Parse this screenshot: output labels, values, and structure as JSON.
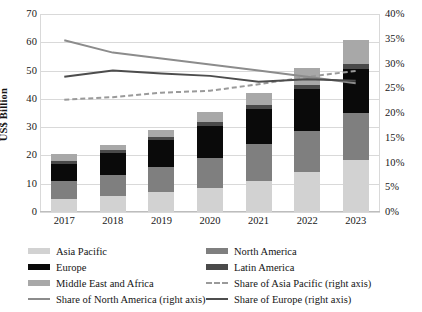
{
  "chart_data": {
    "type": "bar",
    "title": "",
    "subtitle": "",
    "xlabel": "",
    "ylabel": "US$ Billion",
    "y2label": "",
    "categories": [
      "2017",
      "2018",
      "2019",
      "2020",
      "2021",
      "2022",
      "2023"
    ],
    "ylim": [
      0,
      70
    ],
    "yticks": [
      0,
      10,
      20,
      30,
      40,
      50,
      60,
      70
    ],
    "ytick_labels": [
      "0",
      "10",
      "20",
      "30",
      "40",
      "50",
      "60",
      "70"
    ],
    "y2lim": [
      0,
      40
    ],
    "y2ticks": [
      0,
      5,
      10,
      15,
      20,
      25,
      30,
      35,
      40
    ],
    "y2tick_labels": [
      "0%",
      "5%",
      "10%",
      "15%",
      "20%",
      "25%",
      "30%",
      "35%",
      "40%"
    ],
    "grid": true,
    "legend_position": "bottom",
    "stacked": true,
    "series": [
      {
        "name": "Asia Pacific",
        "kind": "bar",
        "axis": "left",
        "color": "#d2d2d2",
        "values": [
          4.5,
          5.5,
          7.0,
          8.5,
          11.0,
          14.0,
          18.5
        ]
      },
      {
        "name": "North America",
        "kind": "bar",
        "axis": "left",
        "color": "#7f7f7f",
        "values": [
          6.5,
          7.5,
          9.0,
          10.5,
          13.0,
          14.5,
          16.5
        ]
      },
      {
        "name": "Europe",
        "kind": "bar",
        "axis": "left",
        "color": "#0a0a0a",
        "values": [
          6.0,
          8.0,
          9.5,
          11.5,
          12.5,
          15.0,
          15.5
        ]
      },
      {
        "name": "Latin America",
        "kind": "bar",
        "axis": "left",
        "color": "#4a4a4a",
        "values": [
          1.0,
          0.8,
          1.0,
          1.2,
          1.5,
          1.5,
          2.0
        ]
      },
      {
        "name": "Middle East and Africa",
        "kind": "bar",
        "axis": "left",
        "color": "#a8a8a8",
        "values": [
          2.5,
          2.0,
          2.5,
          3.5,
          4.0,
          6.0,
          8.5
        ]
      },
      {
        "name": "Share of Asia Pacific (right axis)",
        "kind": "line",
        "axis": "right",
        "style": "dashed",
        "color": "#9a9a9a",
        "values": [
          22.7,
          23.2,
          24.1,
          24.5,
          25.8,
          27.3,
          28.5
        ]
      },
      {
        "name": "Share of North America (right axis)",
        "kind": "line",
        "axis": "right",
        "style": "solid",
        "color": "#8c8c8c",
        "values": [
          34.7,
          32.2,
          31.0,
          29.8,
          28.6,
          27.3,
          26.0
        ]
      },
      {
        "name": "Share of Europe (right axis)",
        "kind": "line",
        "axis": "right",
        "style": "solid",
        "color": "#4d4d4d",
        "values": [
          27.3,
          28.6,
          28.0,
          27.5,
          26.3,
          26.8,
          26.5
        ]
      }
    ],
    "totals": [
      20.5,
      23.8,
      29.0,
      35.2,
      42.0,
      51.0,
      61.0
    ]
  },
  "legend": {
    "items": [
      {
        "label": "Asia Pacific",
        "marker": "swatch-light-gray"
      },
      {
        "label": "North America",
        "marker": "swatch-medium-gray"
      },
      {
        "label": "Europe",
        "marker": "swatch-black"
      },
      {
        "label": "Latin America",
        "marker": "swatch-dark-gray"
      },
      {
        "label": "Middle East and Africa",
        "marker": "swatch-gray"
      },
      {
        "label": "Share of Asia Pacific (right axis)",
        "marker": "dashed-line-gray"
      },
      {
        "label": "Share of North America (right axis)",
        "marker": "solid-line-light-gray"
      },
      {
        "label": "Share of Europe (right axis)",
        "marker": "solid-line-dark-gray"
      }
    ]
  },
  "colors": {
    "asia_pacific": "#d2d2d2",
    "north_america": "#7f7f7f",
    "europe": "#0a0a0a",
    "latin_america": "#4a4a4a",
    "middle_east_africa": "#a8a8a8",
    "share_asia_pacific": "#9a9a9a",
    "share_north_america": "#8c8c8c",
    "share_europe": "#4d4d4d",
    "grid": "#d9d9d9",
    "background": "#ffffff",
    "text": "#1b1b1b"
  }
}
